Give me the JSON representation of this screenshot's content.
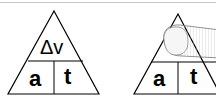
{
  "panels": [
    {
      "top_label": "Δv",
      "bottom_left": "a",
      "bottom_right": "t",
      "covered": false
    },
    {
      "top_label": "Δv",
      "bottom_left": "a",
      "bottom_right": "t",
      "covered": true,
      "cover_icon": "finger-icon"
    }
  ],
  "colors": {
    "line": "#000000",
    "top_rule": "#c8c8c8",
    "finger_fill": "#f2f2f2",
    "finger_stroke": "#888888"
  }
}
